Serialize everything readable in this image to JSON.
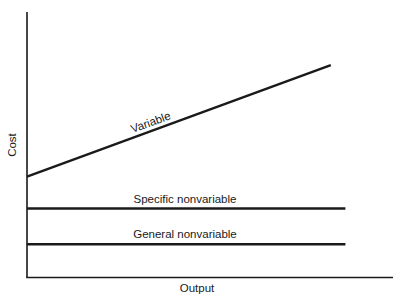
{
  "chart_data": {
    "type": "line",
    "title": "",
    "xlabel": "Output",
    "ylabel": "Cost",
    "grid": false,
    "legend": "none (inline line labels)",
    "ticks": "none",
    "xlim": [
      0,
      1
    ],
    "ylim": [
      0,
      1
    ],
    "series": [
      {
        "name": "Variable",
        "label": "Variable",
        "x": [
          0,
          0.83
        ],
        "y": [
          0.38,
          0.8
        ]
      },
      {
        "name": "Specific nonvariable",
        "label": "Specific nonvariable",
        "x": [
          0,
          0.87
        ],
        "y": [
          0.26,
          0.26
        ]
      },
      {
        "name": "General nonvariable",
        "label": "General nonvariable",
        "x": [
          0,
          0.87
        ],
        "y": [
          0.125,
          0.125
        ]
      }
    ]
  },
  "axes": {
    "x_label": "Output",
    "y_label": "Cost"
  },
  "labels": {
    "variable": "Variable",
    "specific": "Specific nonvariable",
    "general": "General nonvariable"
  },
  "colors": {
    "ink": "#1a1a1a",
    "background": "#ffffff"
  }
}
